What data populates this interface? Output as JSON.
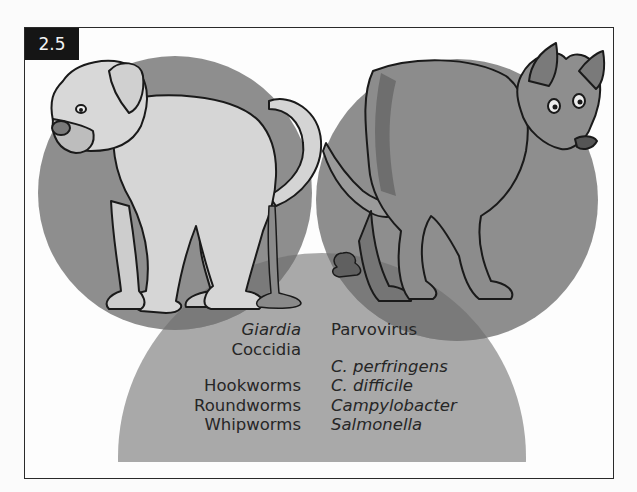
{
  "figure": {
    "label": "2.5"
  },
  "venn": {
    "circles": [
      {
        "name": "left-dog-circle",
        "color": "#8e8e8e"
      },
      {
        "name": "right-dog-circle",
        "color": "#8e8e8e"
      },
      {
        "name": "bottom-overlap-circle",
        "color": "#a9a9a9"
      }
    ],
    "left_dog": {
      "description": "light-colored boxer-type dog squatting with liquid stool (diarrhea)"
    },
    "right_dog": {
      "description": "dark-furred dog squatting with formed stool"
    }
  },
  "lists": {
    "left": [
      {
        "text": "Giardia",
        "italic": true
      },
      {
        "text": "Coccidia",
        "italic": false
      },
      {
        "text": "Hookworms",
        "italic": false
      },
      {
        "text": "Roundworms",
        "italic": false
      },
      {
        "text": "Whipworms",
        "italic": false
      }
    ],
    "right": [
      {
        "text": "Parvovirus",
        "italic": false
      },
      {
        "text": "C. perfringens",
        "italic": true
      },
      {
        "text": "C. difficile",
        "italic": true
      },
      {
        "text": "Campylobacter",
        "italic": true
      },
      {
        "text": "Salmonella",
        "italic": true
      }
    ]
  }
}
